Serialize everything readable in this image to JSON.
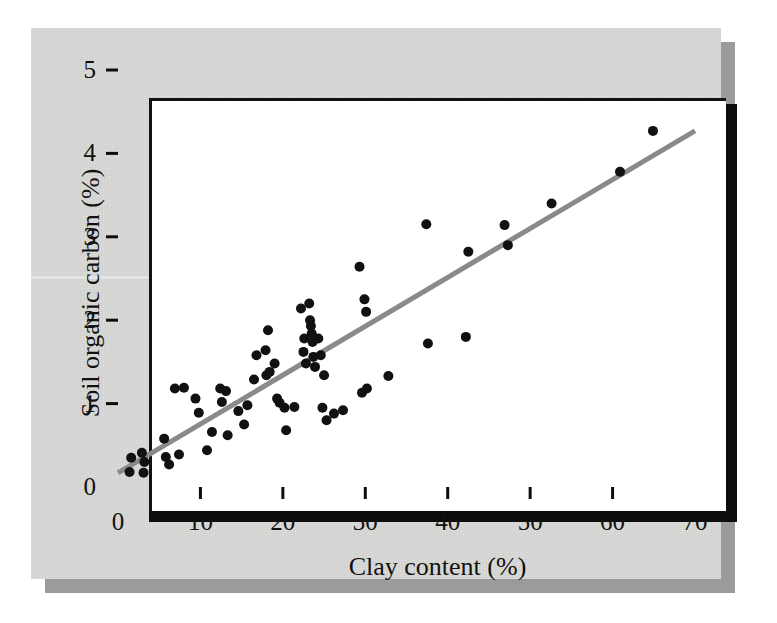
{
  "figure": {
    "colors": {
      "page_background": "#d8d8d6",
      "plot_background": "#ffffff",
      "axis": "#0d0d0d",
      "point": "#111111",
      "trend_line": "#8a8a8a",
      "shadow": "#9b9b9b"
    }
  },
  "chart_data": {
    "type": "scatter",
    "title": "",
    "xlabel": "Clay content (%)",
    "ylabel": "Soil organic carbon (%)",
    "xlim": [
      0,
      70
    ],
    "ylim": [
      0,
      5
    ],
    "xticks": [
      0,
      10,
      20,
      30,
      40,
      50,
      60,
      70
    ],
    "yticks": [
      0,
      1,
      2,
      3,
      4,
      5
    ],
    "xtick_labels": [
      "0",
      "10",
      "20",
      "30",
      "40",
      "50",
      "60",
      "70"
    ],
    "ytick_labels": [
      "0",
      "1",
      "2",
      "3",
      "4",
      "5"
    ],
    "grid": false,
    "legend": null,
    "marker": {
      "shape": "circle",
      "size": 9,
      "color": "#111111"
    },
    "series": [
      {
        "name": "Soil samples",
        "type": "scatter",
        "points": [
          [
            1.4,
            0.18
          ],
          [
            1.6,
            0.35
          ],
          [
            2.9,
            0.41
          ],
          [
            3.1,
            0.17
          ],
          [
            3.2,
            0.3
          ],
          [
            5.6,
            0.58
          ],
          [
            5.8,
            0.36
          ],
          [
            6.2,
            0.27
          ],
          [
            6.9,
            1.18
          ],
          [
            7.4,
            0.39
          ],
          [
            8.0,
            1.19
          ],
          [
            9.4,
            1.06
          ],
          [
            9.8,
            0.89
          ],
          [
            10.8,
            0.44
          ],
          [
            11.4,
            0.66
          ],
          [
            12.4,
            1.18
          ],
          [
            12.6,
            1.02
          ],
          [
            13.1,
            1.15
          ],
          [
            13.3,
            0.62
          ],
          [
            14.6,
            0.91
          ],
          [
            15.3,
            0.75
          ],
          [
            15.7,
            0.98
          ],
          [
            16.5,
            1.29
          ],
          [
            16.8,
            1.58
          ],
          [
            17.9,
            1.64
          ],
          [
            18.0,
            1.34
          ],
          [
            18.2,
            1.88
          ],
          [
            18.4,
            1.38
          ],
          [
            19.0,
            1.48
          ],
          [
            19.3,
            1.06
          ],
          [
            19.6,
            1.01
          ],
          [
            20.2,
            0.95
          ],
          [
            20.4,
            0.68
          ],
          [
            21.4,
            0.96
          ],
          [
            22.2,
            2.14
          ],
          [
            22.5,
            1.62
          ],
          [
            22.6,
            1.78
          ],
          [
            22.8,
            1.48
          ],
          [
            23.2,
            2.2
          ],
          [
            23.3,
            2.0
          ],
          [
            23.4,
            1.93
          ],
          [
            23.5,
            1.84
          ],
          [
            23.6,
            1.74
          ],
          [
            23.7,
            1.56
          ],
          [
            23.9,
            1.44
          ],
          [
            24.3,
            1.78
          ],
          [
            24.6,
            1.58
          ],
          [
            24.8,
            0.95
          ],
          [
            25.0,
            1.34
          ],
          [
            25.3,
            0.8
          ],
          [
            26.2,
            0.88
          ],
          [
            27.3,
            0.92
          ],
          [
            29.3,
            2.64
          ],
          [
            29.6,
            1.13
          ],
          [
            29.9,
            2.25
          ],
          [
            30.1,
            2.1
          ],
          [
            30.2,
            1.18
          ],
          [
            32.8,
            1.33
          ],
          [
            37.4,
            3.15
          ],
          [
            37.6,
            1.72
          ],
          [
            42.2,
            1.8
          ],
          [
            42.5,
            2.82
          ],
          [
            46.9,
            3.14
          ],
          [
            47.3,
            2.9
          ],
          [
            52.6,
            3.4
          ],
          [
            60.9,
            3.78
          ],
          [
            64.9,
            4.27
          ]
        ]
      }
    ],
    "trend_line": {
      "name": "Regression line",
      "type": "line",
      "color": "#8a8a8a",
      "width": 5,
      "x_start": 0,
      "y_start": 0.17,
      "x_end": 70,
      "y_end": 4.27
    }
  }
}
